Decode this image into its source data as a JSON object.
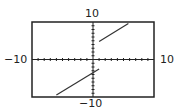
{
  "chart_data": {
    "type": "line",
    "title": "",
    "xlabel": "",
    "ylabel": "",
    "xlim": [
      -10,
      10
    ],
    "ylim": [
      -10,
      10
    ],
    "grid": false,
    "tick_spacing": 1,
    "tick_labels": {
      "x_min": "−10",
      "x_max": "10",
      "y_min": "−10",
      "y_max": "10"
    },
    "series": [
      {
        "name": "lower-piece",
        "x": [
          -6,
          1
        ],
        "y": [
          -9.5,
          -2.5
        ]
      },
      {
        "name": "upper-piece",
        "x": [
          1,
          5.8
        ],
        "y": [
          4.8,
          9.6
        ]
      }
    ],
    "annotations": [
      "jump discontinuity near x = 1"
    ]
  },
  "colors": {
    "frame": "#222222",
    "line": "#333333",
    "axis": "#222222"
  }
}
